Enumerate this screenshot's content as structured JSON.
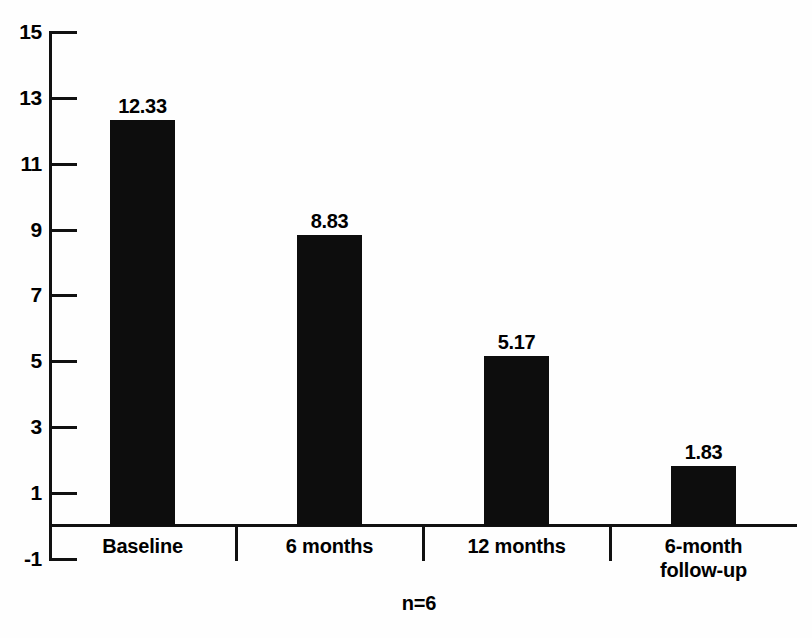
{
  "chart_data": {
    "type": "bar",
    "title": "",
    "subtitle": "",
    "xlabel": "",
    "ylabel": "",
    "categories": [
      "Baseline",
      "6 months",
      "12 months",
      "6-month\nfollow-up"
    ],
    "values": [
      12.33,
      8.83,
      5.17,
      1.83
    ],
    "value_labels": [
      "12.33",
      "8.83",
      "5.17",
      "1.83"
    ],
    "ylim": [
      -1,
      15
    ],
    "yticks": [
      15,
      13,
      11,
      9,
      7,
      5,
      3,
      1,
      -1
    ],
    "ytick_labels": [
      "15",
      "13",
      "11",
      "9",
      "7",
      "5",
      "3",
      "1",
      "-1"
    ],
    "grid": false,
    "legend": null,
    "annotations": [
      "n=6"
    ],
    "bar_color": "#0d0d0d",
    "axis_color": "#111111",
    "background_color": "#fefefe"
  },
  "footer": {
    "sample_size": "n=6"
  }
}
